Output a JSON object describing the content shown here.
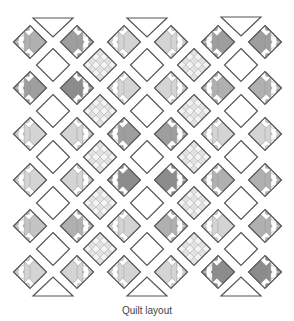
{
  "caption": "Quilt layout",
  "colors": {
    "outline": "#555555",
    "inner_line": "#8a8a8a",
    "white": "#ffffff",
    "shades": {
      "light": "#d4d4d4",
      "midlight": "#c4c4c4",
      "mid": "#b0b0b0",
      "middark": "#9e9e9e",
      "dark": "#8c8c8c"
    },
    "checker_a": "#e2e2e2",
    "checker_b": "#f4f4f4"
  },
  "grid": {
    "row_a_x": [
      30,
      77,
      124,
      171,
      218,
      265
    ],
    "row_a_y": [
      42,
      88,
      134,
      180,
      226,
      272
    ],
    "row_b_x": [
      53,
      100,
      147,
      194,
      241
    ],
    "row_b_y": [
      65,
      111,
      157,
      203,
      249
    ],
    "half": 16.5,
    "row_b_types": [
      "white",
      "checker",
      "white",
      "checker",
      "white"
    ]
  },
  "blocks": [
    [
      "mid",
      "middark",
      "light",
      "light",
      "middark",
      "middark"
    ],
    [
      "middark",
      "dark",
      "light",
      "light",
      "mid",
      "mid"
    ],
    [
      "light",
      "light",
      "middark",
      "middark",
      "light",
      "light"
    ],
    [
      "light",
      "light",
      "dark",
      "dark",
      "mid",
      "mid"
    ],
    [
      "midlight",
      "mid",
      "light",
      "mid",
      "light",
      "mid"
    ],
    [
      "light",
      "light",
      "light",
      "light",
      "dark",
      "dark"
    ]
  ],
  "setting_triangles": {
    "top": [
      {
        "x": 53,
        "y": 18
      },
      {
        "x": 147,
        "y": 18
      },
      {
        "x": 241,
        "y": 17
      }
    ],
    "bottom": [
      {
        "x": 53,
        "y": 296
      },
      {
        "x": 147,
        "y": 296
      },
      {
        "x": 241,
        "y": 296
      }
    ],
    "half_width": 20,
    "height": 19
  }
}
